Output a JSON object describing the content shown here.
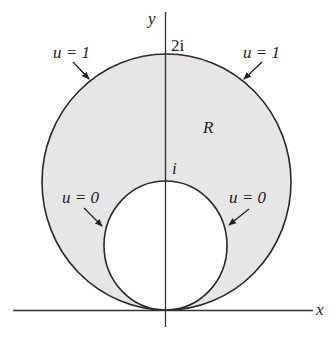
{
  "diagram": {
    "type": "complex-plane region between two tangent circles",
    "axes": {
      "x_label": "x",
      "y_label": "y"
    },
    "ticks": {
      "outer_top": "2i",
      "inner_top": "i"
    },
    "region_label": "R",
    "boundary_labels": {
      "outer_left": "u = 1",
      "outer_right": "u = 1",
      "inner_left": "u = 0",
      "inner_right": "u = 0"
    },
    "colors": {
      "region_fill": "#e6e6e6",
      "stroke": "#2a2a2a",
      "background": "#ffffff"
    }
  }
}
